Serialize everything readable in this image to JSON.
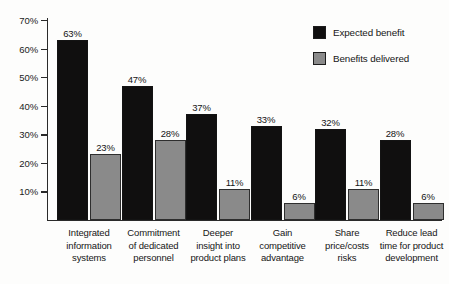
{
  "chart_data": {
    "type": "bar",
    "title": "",
    "subtitle": "",
    "xlabel": "",
    "ylabel": "",
    "ylim": [
      0,
      70
    ],
    "ytick_labels": [
      "70%",
      "60%",
      "50%",
      "40%",
      "30%",
      "20%",
      "10%"
    ],
    "ytick_values": [
      70,
      60,
      50,
      40,
      30,
      20,
      10
    ],
    "grid": false,
    "legend_position": "top-right",
    "categories": [
      "Integrated information systems",
      "Commitment of dedicated personnel",
      "Deeper insight into product plans",
      "Gain competitive advantage",
      "Share price/costs risks",
      "Reduce lead time for product development"
    ],
    "category_lines": [
      [
        "Integrated",
        "information",
        "systems"
      ],
      [
        "Commitment",
        "of dedicated",
        "personnel"
      ],
      [
        "Deeper",
        "insight into",
        "product plans"
      ],
      [
        "Gain",
        "competitive",
        "advantage"
      ],
      [
        "Share",
        "price/costs",
        "risks"
      ],
      [
        "Reduce lead",
        "time for product",
        "development"
      ]
    ],
    "series": [
      {
        "name": "Expected benefit",
        "color": "#100f0f",
        "values": [
          63,
          47,
          37,
          33,
          32,
          28
        ],
        "value_labels": [
          "63%",
          "47%",
          "37%",
          "33%",
          "32%",
          "28%"
        ]
      },
      {
        "name": "Benefits delivered",
        "color": "#8a8a8a",
        "values": [
          23,
          28,
          11,
          6,
          11,
          6
        ],
        "value_labels": [
          "23%",
          "28%",
          "11%",
          "6%",
          "11%",
          "6%"
        ]
      }
    ]
  },
  "legend": {
    "items": [
      {
        "label": "Expected benefit",
        "color": "#100f0f"
      },
      {
        "label": "Benefits delivered",
        "color": "#8a8a8a"
      }
    ]
  }
}
